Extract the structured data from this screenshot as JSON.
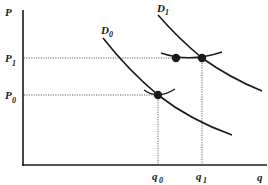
{
  "diagram": {
    "type": "supply-demand-shift",
    "axes": {
      "y_label": "P",
      "x_label": "q"
    },
    "price_levels": [
      {
        "label": "P",
        "sub": "1",
        "y": 58
      },
      {
        "label": "P",
        "sub": "0",
        "y": 95
      }
    ],
    "quantity_levels": [
      {
        "label": "q",
        "sub": "0",
        "x": 158
      },
      {
        "label": "q",
        "sub": "1",
        "x": 202
      }
    ],
    "curves": [
      {
        "label": "D",
        "sub": "0",
        "name": "demand-curve-d0"
      },
      {
        "label": "D",
        "sub": "1",
        "name": "demand-curve-d1"
      }
    ],
    "points": [
      {
        "name": "equilibrium-point-p0-q0",
        "x": 158,
        "y": 95
      },
      {
        "name": "intermediate-point-p1",
        "x": 176,
        "y": 58
      },
      {
        "name": "equilibrium-point-p1-q1",
        "x": 202,
        "y": 58
      }
    ],
    "colors": {
      "ink": "#1a1a1a",
      "guide": "#555555",
      "background": "#ffffff"
    }
  }
}
